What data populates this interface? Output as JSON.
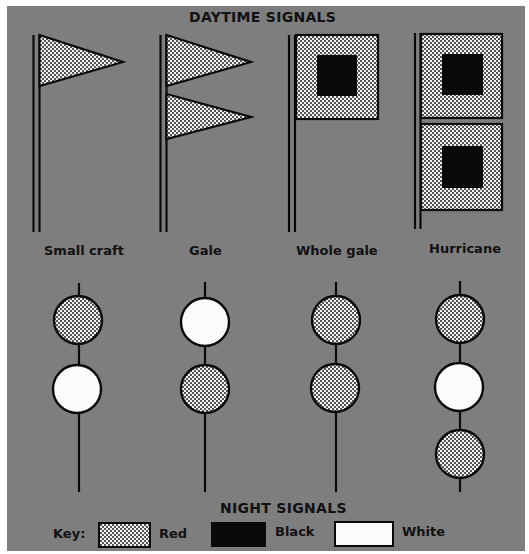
{
  "colors": {
    "background": "#7e7e7e",
    "red_fill_base": "#f2f2f2",
    "red_fill_dot": "#111111",
    "black": "#0a0a0a",
    "white": "#fbfbfb",
    "outline": "#0a0a0a"
  },
  "daytime": {
    "title": "DAYTIME SIGNALS",
    "signals": [
      {
        "label": "Small craft",
        "flags": [
          {
            "shape": "pennant",
            "color": "Red"
          }
        ]
      },
      {
        "label": "Gale",
        "flags": [
          {
            "shape": "pennant",
            "color": "Red"
          },
          {
            "shape": "pennant",
            "color": "Red"
          }
        ]
      },
      {
        "label": "Whole gale",
        "flags": [
          {
            "shape": "square",
            "color": "Red",
            "center": "Black"
          }
        ]
      },
      {
        "label": "Hurricane",
        "flags": [
          {
            "shape": "square",
            "color": "Red",
            "center": "Black"
          },
          {
            "shape": "square",
            "color": "Red",
            "center": "Black"
          }
        ]
      }
    ]
  },
  "night": {
    "title": "NIGHT SIGNALS",
    "signals": [
      {
        "label": "Small craft",
        "lights": [
          "Red",
          "White"
        ]
      },
      {
        "label": "Gale",
        "lights": [
          "White",
          "Red"
        ]
      },
      {
        "label": "Whole gale",
        "lights": [
          "Red",
          "Red"
        ]
      },
      {
        "label": "Hurricane",
        "lights": [
          "Red",
          "White",
          "Red"
        ]
      }
    ]
  },
  "key": {
    "label": "Key:",
    "items": [
      {
        "name": "Red",
        "label": "Red"
      },
      {
        "name": "Black",
        "label": "Black"
      },
      {
        "name": "White",
        "label": "White"
      }
    ]
  }
}
